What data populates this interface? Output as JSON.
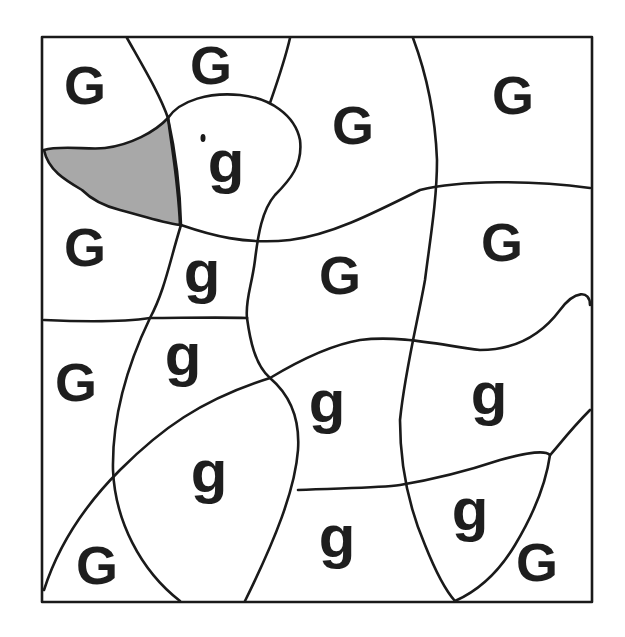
{
  "puzzle": {
    "type": "color-by-letter",
    "hidden_picture": "duck",
    "colors": {
      "line": "#1a1a1a",
      "filled_region": "#a8a8a8",
      "background": "#ffffff"
    },
    "filled_region": "beak",
    "letters": [
      {
        "text": "G",
        "x": 85,
        "y": 85
      },
      {
        "text": "G",
        "x": 211,
        "y": 65
      },
      {
        "text": "G",
        "x": 353,
        "y": 125
      },
      {
        "text": "G",
        "x": 513,
        "y": 95
      },
      {
        "text": "g",
        "x": 226,
        "y": 170
      },
      {
        "text": "G",
        "x": 85,
        "y": 247
      },
      {
        "text": "g",
        "x": 202,
        "y": 280
      },
      {
        "text": "G",
        "x": 340,
        "y": 275
      },
      {
        "text": "G",
        "x": 502,
        "y": 242
      },
      {
        "text": "g",
        "x": 183,
        "y": 363
      },
      {
        "text": "G",
        "x": 76,
        "y": 382
      },
      {
        "text": "g",
        "x": 327,
        "y": 410
      },
      {
        "text": "g",
        "x": 489,
        "y": 402
      },
      {
        "text": "g",
        "x": 209,
        "y": 480
      },
      {
        "text": "g",
        "x": 470,
        "y": 518
      },
      {
        "text": "g",
        "x": 337,
        "y": 545
      },
      {
        "text": "G",
        "x": 97,
        "y": 565
      },
      {
        "text": "G",
        "x": 537,
        "y": 562
      }
    ]
  }
}
